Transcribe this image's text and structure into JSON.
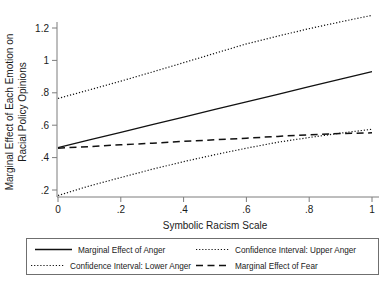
{
  "chart_data": {
    "type": "line",
    "title": "",
    "xlabel": "Symbolic Racism Scale",
    "ylabel": "Marginal Effect of Each Emotion on Racial Policy Opinions",
    "ylabel_line1": "Marginal Effect of Each Emotion on",
    "ylabel_line2": "Racial Policy Opinions",
    "xlim": [
      0,
      1
    ],
    "ylim": [
      0.13,
      1.3
    ],
    "grid": false,
    "legend_position": "bottom",
    "xticks": [
      0,
      0.2,
      0.4,
      0.6,
      0.8,
      1
    ],
    "xtick_labels": [
      "0",
      ".2",
      ".4",
      ".6",
      ".8",
      "1"
    ],
    "yticks": [
      0.2,
      0.4,
      0.6,
      0.8,
      1,
      1.2
    ],
    "ytick_labels": [
      ".2",
      ".4",
      ".6",
      ".8",
      "1",
      "1.2"
    ],
    "x": [
      0,
      0.1,
      0.2,
      0.3,
      0.4,
      0.5,
      0.6,
      0.7,
      0.8,
      0.9,
      1
    ],
    "series": [
      {
        "name": "Marginal Effect of Anger",
        "style": "solid",
        "color": "#111111",
        "values": [
          0.462,
          0.509,
          0.556,
          0.603,
          0.65,
          0.697,
          0.744,
          0.791,
          0.838,
          0.885,
          0.93
        ]
      },
      {
        "name": "Confidence Interval: Upper Anger",
        "style": "dotted",
        "color": "#111111",
        "values": [
          0.765,
          0.818,
          0.872,
          0.928,
          0.986,
          1.044,
          1.102,
          1.15,
          1.196,
          1.238,
          1.278
        ]
      },
      {
        "name": "Confidence Interval: Lower Anger",
        "style": "dotted",
        "color": "#111111",
        "values": [
          0.166,
          0.225,
          0.277,
          0.328,
          0.375,
          0.418,
          0.458,
          0.495,
          0.524,
          0.551,
          0.575
        ]
      },
      {
        "name": "Marginal Effect of Fear",
        "style": "dashed",
        "color": "#111111",
        "values": [
          0.458,
          0.468,
          0.479,
          0.489,
          0.5,
          0.51,
          0.52,
          0.531,
          0.541,
          0.548,
          0.553
        ]
      }
    ]
  },
  "axes": {
    "x_title": "Symbolic Racism Scale",
    "y_title_line1": "Marginal Effect of Each Emotion on",
    "y_title_line2": "Racial Policy Opinions",
    "x_tick_labels": [
      "0",
      ".2",
      ".4",
      ".6",
      ".8",
      "1"
    ],
    "y_tick_labels": [
      ".2",
      ".4",
      ".6",
      ".8",
      "1",
      "1.2"
    ]
  },
  "legend": {
    "entries": [
      {
        "label": "Marginal Effect of Anger",
        "style": "solid"
      },
      {
        "label": "Confidence Interval: Upper Anger",
        "style": "dotted"
      },
      {
        "label": "Confidence Interval: Lower Anger",
        "style": "dotted"
      },
      {
        "label": "Marginal Effect of Fear",
        "style": "dashed"
      }
    ]
  }
}
